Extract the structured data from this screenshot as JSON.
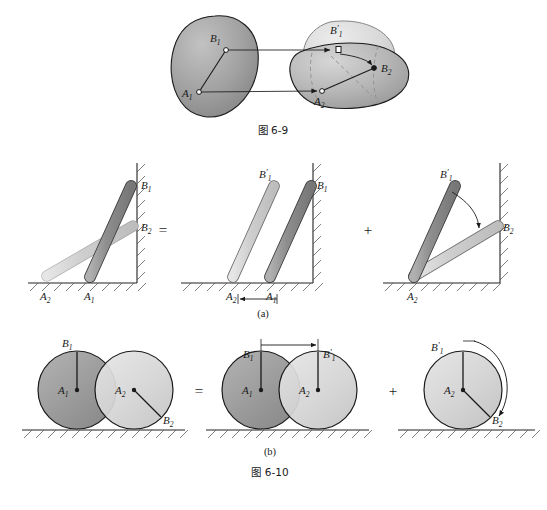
{
  "document": {
    "type": "mechanics-textbook-figure",
    "page_background": "#ffffff"
  },
  "colors": {
    "body_dark": "#9a9a9a",
    "body_light": "#d4d4d4",
    "body_mid": "#b9b9b9",
    "outline": "#1a1a1a",
    "hatch": "#555555",
    "arrow": "#1a1a1a",
    "dashed": "#8f8f8f"
  },
  "figures": [
    {
      "id": "fig-6-9",
      "caption": "图 6-9",
      "description": "General plane motion of a rigid body decomposed into translation and rotation",
      "labels": [
        {
          "name": "A1",
          "base": "A",
          "sub": "1",
          "prime": false
        },
        {
          "name": "B1",
          "base": "B",
          "sub": "1",
          "prime": false
        },
        {
          "name": "B1p",
          "base": "B",
          "sub": "1",
          "prime": true
        },
        {
          "name": "A2",
          "base": "A",
          "sub": "2",
          "prime": false
        },
        {
          "name": "B2",
          "base": "B",
          "sub": "2",
          "prime": false
        }
      ],
      "bodies": [
        {
          "name": "initial-position-blob",
          "shade": "dark"
        },
        {
          "name": "translated-position-blob",
          "shade": "light"
        },
        {
          "name": "final-position-blob",
          "shade": "mid"
        }
      ],
      "arrows": [
        {
          "name": "translation-arrow-A",
          "from": "A1",
          "to": "A2",
          "style": "straight"
        },
        {
          "name": "translation-arrow-B",
          "from": "B1",
          "to": "B1p",
          "style": "straight"
        },
        {
          "name": "rotation-arrow-B",
          "from": "B1p",
          "to": "B2",
          "style": "curved"
        }
      ]
    },
    {
      "id": "fig-6-10",
      "caption": "图 6-10",
      "parts": [
        {
          "id": "part-a",
          "label": "(a)",
          "description": "Rod leaning on wall and floor: motion equals translation plus rotation",
          "panels": [
            {
              "name": "panel-a-combined",
              "labels": [
                "B1",
                "B2",
                "A2",
                "A1"
              ],
              "operator_after": "="
            },
            {
              "name": "panel-a-translation",
              "labels": [
                "B1p",
                "B1",
                "A2",
                "A1"
              ],
              "operator_after": "+",
              "dimension_arrow": {
                "name": "translation-distance-arrow",
                "from": "A2",
                "to": "A1"
              }
            },
            {
              "name": "panel-a-rotation",
              "labels": [
                "B1p",
                "B2",
                "A2"
              ],
              "operator_after": "",
              "rotation_arrow": {
                "name": "rotation-arc-arrow",
                "from": "B1p",
                "to": "B2"
              }
            }
          ]
        },
        {
          "id": "part-b",
          "label": "(b)",
          "description": "Rolling disc: motion equals translation plus rotation",
          "panels": [
            {
              "name": "panel-b-combined",
              "labels": [
                "B1",
                "A1",
                "A2",
                "B2"
              ],
              "operator_after": "="
            },
            {
              "name": "panel-b-translation",
              "labels": [
                "B1",
                "B1p",
                "A1",
                "A2"
              ],
              "operator_after": "+",
              "dimension_arrow": {
                "name": "translation-distance-arrow",
                "from": "B1",
                "to": "B1p"
              }
            },
            {
              "name": "panel-b-rotation",
              "labels": [
                "B1p",
                "A2",
                "B2"
              ],
              "operator_after": "",
              "rotation_arrow": {
                "name": "rotation-arc-arrow",
                "from": "B1p",
                "to": "B2"
              }
            }
          ]
        }
      ]
    }
  ],
  "text": {
    "caption_6_9": "图 6-9",
    "caption_6_10": "图 6-10",
    "part_a": "(a)",
    "part_b": "(b)",
    "equals": "=",
    "plus": "+",
    "A": "A",
    "B": "B",
    "one": "1",
    "two": "2",
    "prime": "′"
  }
}
